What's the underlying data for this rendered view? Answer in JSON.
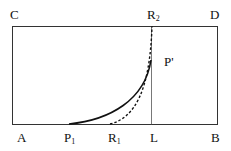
{
  "diagram": {
    "labels": {
      "A": "A",
      "B": "B",
      "C": "C",
      "D": "D",
      "P1": "P",
      "P1_sub": "1",
      "R1": "R",
      "R1_sub": "1",
      "R2": "R",
      "R2_sub": "2",
      "L": "L",
      "Pprime": "P'"
    },
    "elements": [
      "rectangle ABDC",
      "vertical line from L to top edge at R2",
      "solid curve from P1 to P'",
      "dashed curve from R1 to R2"
    ],
    "colors": {
      "stroke": "#111111",
      "background": "#ffffff"
    }
  }
}
